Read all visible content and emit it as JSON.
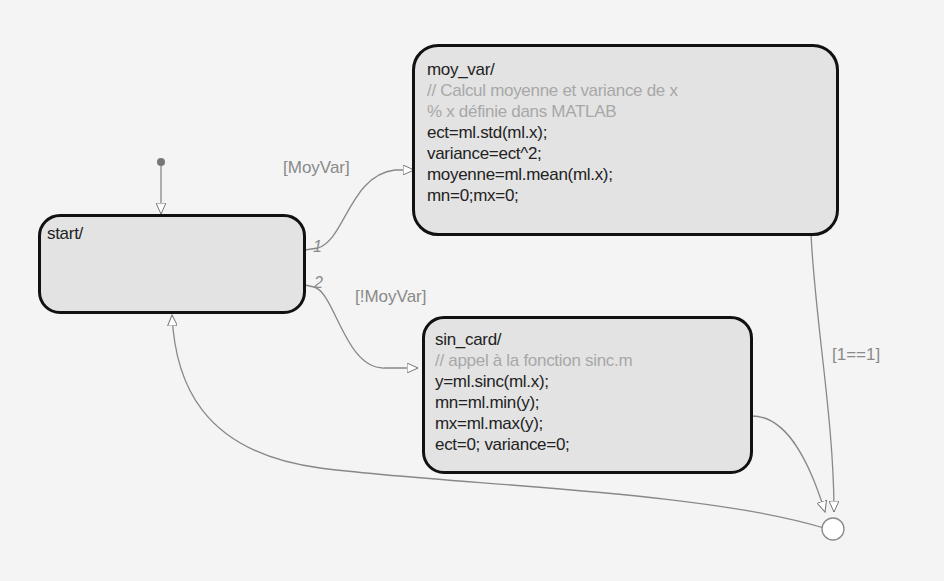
{
  "diagram": {
    "type": "stateflow-chart",
    "colors": {
      "state_fill": "#e3e3e3",
      "state_border": "#111111",
      "wire": "#888888",
      "comment": "#a8a8a8",
      "background": "#f4f4f4"
    },
    "states": {
      "start": {
        "title": "start/"
      },
      "moy_var": {
        "title": "moy_var/",
        "lines": [
          {
            "text": "// Calcul moyenne et variance de x",
            "comment": true
          },
          {
            "text": "% x définie dans MATLAB",
            "comment": true
          },
          {
            "text": "ect=ml.std(ml.x);"
          },
          {
            "text": "variance=ect^2;"
          },
          {
            "text": "moyenne=ml.mean(ml.x);"
          },
          {
            "text": "mn=0;mx=0;"
          }
        ]
      },
      "sin_card": {
        "title": "sin_card/",
        "lines": [
          {
            "text": "// appel à la fonction sinc.m",
            "comment": true
          },
          {
            "text": "y=ml.sinc(ml.x);"
          },
          {
            "text": "mn=ml.min(y);"
          },
          {
            "text": "mx=ml.max(y);"
          },
          {
            "text": "ect=0; variance=0;"
          }
        ]
      }
    },
    "transitions": [
      {
        "from": "default",
        "to": "start",
        "label": ""
      },
      {
        "from": "start",
        "to": "moy_var",
        "order": "1",
        "label": "[MoyVar]"
      },
      {
        "from": "start",
        "to": "sin_card",
        "order": "2",
        "label": "[!MoyVar]"
      },
      {
        "from": "moy_var",
        "to": "junction",
        "label": "[1==1]"
      },
      {
        "from": "sin_card",
        "to": "junction",
        "label": ""
      },
      {
        "from": "junction",
        "to": "start",
        "label": ""
      }
    ]
  }
}
